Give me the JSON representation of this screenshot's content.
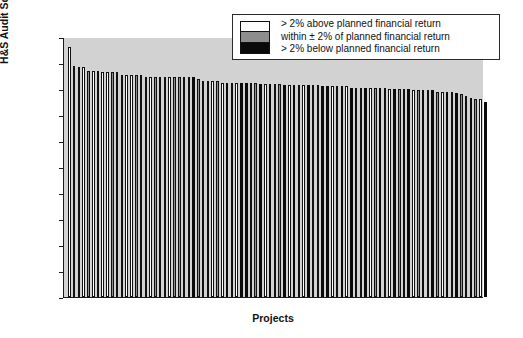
{
  "chart_data": {
    "type": "bar",
    "title": "",
    "xlabel": "Projects",
    "ylabel": "H&S Audit Score %",
    "ylim": [
      0,
      100
    ],
    "ytick_labels": [
      "10",
      "90",
      "80",
      "70",
      "60",
      "50",
      "40",
      "30",
      "20",
      "10",
      "0"
    ],
    "ytick_values": [
      100,
      90,
      80,
      70,
      60,
      50,
      40,
      30,
      20,
      10,
      0
    ],
    "xtick_labels": [],
    "grid": false,
    "legend_position": "top-right",
    "categories": [
      "P1",
      "P2",
      "P3",
      "P4",
      "P5",
      "P6",
      "P7",
      "P8",
      "P9",
      "P10",
      "P11",
      "P12",
      "P13",
      "P14",
      "P15",
      "P16",
      "P17",
      "P18",
      "P19",
      "P20",
      "P21",
      "P22",
      "P23",
      "P24",
      "P25",
      "P26",
      "P27",
      "P28",
      "P29",
      "P30",
      "P31",
      "P32",
      "P33",
      "P34",
      "P35",
      "P36",
      "P37",
      "P38",
      "P39",
      "P40",
      "P41",
      "P42",
      "P43",
      "P44",
      "P45",
      "P46",
      "P47",
      "P48",
      "P49",
      "P50",
      "P51",
      "P52",
      "P53",
      "P54",
      "P55",
      "P56",
      "P57",
      "P58",
      "P59",
      "P60",
      "P61",
      "P62",
      "P63",
      "P64",
      "P65",
      "P66",
      "P67",
      "P68",
      "P69",
      "P70",
      "P71",
      "P72",
      "P73",
      "P74",
      "P75",
      "P76",
      "P77",
      "P78",
      "P79",
      "P80",
      "P81",
      "P82",
      "P83",
      "P84",
      "P85",
      "P86",
      "P87",
      "P88"
    ],
    "values": [
      96,
      89,
      88.5,
      88.5,
      87,
      87,
      87,
      86.5,
      86.5,
      86.5,
      86.5,
      85.5,
      85.5,
      85.5,
      85.5,
      85.5,
      84.5,
      84.5,
      84.5,
      84.5,
      84.5,
      84.5,
      84.5,
      84.5,
      84.5,
      84.5,
      84.5,
      84,
      83,
      83,
      83,
      83,
      82.5,
      82.5,
      82.5,
      82.5,
      82.5,
      82.5,
      82.5,
      82.5,
      82,
      82,
      82,
      82,
      82,
      81.5,
      81.5,
      81.5,
      81.5,
      81.5,
      81.5,
      81.5,
      81.5,
      81,
      81,
      81,
      81,
      81,
      81,
      80.5,
      80.5,
      80.5,
      80.5,
      80.5,
      80.5,
      80.5,
      80.5,
      80,
      80,
      80,
      80,
      80,
      79.5,
      79.5,
      79.5,
      79.5,
      79.5,
      79,
      79,
      79,
      79,
      78.5,
      78,
      77.5,
      76.5,
      76,
      76,
      75
    ],
    "series_categories": [
      "white",
      "white",
      "gray",
      "white",
      "gray",
      "white",
      "gray",
      "white",
      "white",
      "gray",
      "white",
      "gray",
      "white",
      "white",
      "gray",
      "white",
      "gray",
      "white",
      "gray",
      "white",
      "gray",
      "white",
      "gray",
      "gray",
      "white",
      "white",
      "black",
      "gray",
      "white",
      "gray",
      "white",
      "gray",
      "white",
      "black",
      "gray",
      "white",
      "black",
      "black",
      "white",
      "gray",
      "black",
      "white",
      "black",
      "white",
      "gray",
      "black",
      "white",
      "black",
      "gray",
      "white",
      "black",
      "white",
      "gray",
      "black",
      "black",
      "white",
      "gray",
      "black",
      "white",
      "black",
      "gray",
      "white",
      "black",
      "white",
      "gray",
      "black",
      "white",
      "white",
      "black",
      "gray",
      "white",
      "black",
      "white",
      "gray",
      "black",
      "white",
      "black",
      "gray",
      "white",
      "black",
      "white",
      "black",
      "gray",
      "white",
      "black",
      "gray",
      "white",
      "black"
    ],
    "legend": [
      {
        "swatch": "white",
        "label": "> 2% above planned financial return"
      },
      {
        "swatch": "gray",
        "label": "within ± 2% of planned financial return"
      },
      {
        "swatch": "black",
        "label": "> 2% below planned financial return"
      }
    ],
    "colors": {
      "white": "#ffffff",
      "gray": "#8d8d8d",
      "black": "#0a0a0a",
      "plot_background": "#d2d2d2",
      "axis": "#1a1a1a",
      "page_background": "#ffffff"
    }
  }
}
